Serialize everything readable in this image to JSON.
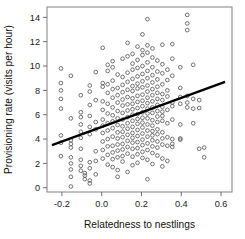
{
  "chart_data": {
    "type": "scatter",
    "title": "",
    "xlabel": "Relatedness to nestlings",
    "ylabel": "Provisioning rate (visits per hour)",
    "xlim": [
      -0.275,
      0.655
    ],
    "ylim": [
      -0.35,
      14.85
    ],
    "xticks": [
      -0.2,
      0.0,
      0.2,
      0.4,
      0.6
    ],
    "xticklabels": [
      "-0.2",
      "0.0",
      "0.2",
      "0.4",
      "0.6"
    ],
    "yticks": [
      0,
      2,
      4,
      6,
      8,
      10,
      12,
      14
    ],
    "yticklabels": [
      "0",
      "2",
      "4",
      "6",
      "8",
      "10",
      "12",
      "14"
    ],
    "grid": false,
    "legend": null,
    "marker": "open-circle",
    "marker_color": "#595959",
    "fit_line": {
      "label": "linear regression fit",
      "color": "#000000",
      "x": [
        -0.25,
        0.62
      ],
      "y": [
        3.5,
        8.7
      ],
      "slope": 5.98,
      "intercept": 4.99
    },
    "points": [
      [
        -0.205,
        9.8
      ],
      [
        -0.205,
        8.6
      ],
      [
        -0.205,
        8.0
      ],
      [
        -0.205,
        7.3
      ],
      [
        -0.205,
        6.5
      ],
      [
        -0.205,
        4.3
      ],
      [
        -0.205,
        3.7
      ],
      [
        -0.205,
        2.6
      ],
      [
        -0.155,
        9.2
      ],
      [
        -0.155,
        5.7
      ],
      [
        -0.155,
        3.9
      ],
      [
        -0.155,
        3.6
      ],
      [
        -0.155,
        3.3
      ],
      [
        -0.155,
        2.5
      ],
      [
        -0.155,
        2.0
      ],
      [
        -0.155,
        1.5
      ],
      [
        -0.155,
        0.9
      ],
      [
        -0.155,
        0.1
      ],
      [
        -0.105,
        7.6
      ],
      [
        -0.105,
        6.2
      ],
      [
        -0.105,
        5.8
      ],
      [
        -0.105,
        5.2
      ],
      [
        -0.105,
        4.6
      ],
      [
        -0.105,
        4.1
      ],
      [
        -0.105,
        3.2
      ],
      [
        -0.105,
        2.3
      ],
      [
        -0.105,
        1.8
      ],
      [
        -0.105,
        1.4
      ],
      [
        -0.085,
        1.2
      ],
      [
        -0.085,
        1.0
      ],
      [
        -0.085,
        0.7
      ],
      [
        -0.06,
        8.4
      ],
      [
        -0.06,
        7.9
      ],
      [
        -0.06,
        6.8
      ],
      [
        -0.06,
        5.9
      ],
      [
        -0.06,
        5.0
      ],
      [
        -0.06,
        4.4
      ],
      [
        -0.06,
        2.1
      ],
      [
        -0.06,
        1.6
      ],
      [
        -0.06,
        0.6
      ],
      [
        -0.06,
        0.35
      ],
      [
        -0.03,
        9.5
      ],
      [
        -0.03,
        7.2
      ],
      [
        -0.03,
        5.4
      ],
      [
        -0.03,
        4.8
      ],
      [
        -0.03,
        3.0
      ],
      [
        -0.03,
        2.2
      ],
      [
        -0.03,
        1.1
      ],
      [
        0.005,
        11.5
      ],
      [
        0.005,
        8.6
      ],
      [
        0.005,
        8.3
      ],
      [
        0.005,
        7.1
      ],
      [
        0.005,
        6.4
      ],
      [
        0.005,
        5.6
      ],
      [
        0.005,
        5.1
      ],
      [
        0.005,
        4.5
      ],
      [
        0.005,
        3.8
      ],
      [
        0.005,
        3.1
      ],
      [
        0.005,
        2.4
      ],
      [
        0.03,
        10.1
      ],
      [
        0.03,
        9.6
      ],
      [
        0.03,
        8.5
      ],
      [
        0.03,
        7.8
      ],
      [
        0.03,
        6.9
      ],
      [
        0.03,
        6.1
      ],
      [
        0.03,
        5.3
      ],
      [
        0.03,
        4.7
      ],
      [
        0.03,
        4.0
      ],
      [
        0.03,
        3.4
      ],
      [
        0.03,
        2.7
      ],
      [
        0.03,
        1.9
      ],
      [
        0.055,
        10.4
      ],
      [
        0.055,
        9.9
      ],
      [
        0.055,
        8.8
      ],
      [
        0.055,
        8.1
      ],
      [
        0.055,
        7.4
      ],
      [
        0.055,
        6.6
      ],
      [
        0.055,
        5.95
      ],
      [
        0.055,
        5.45
      ],
      [
        0.055,
        4.9
      ],
      [
        0.055,
        4.2
      ],
      [
        0.055,
        3.45
      ],
      [
        0.055,
        2.9
      ],
      [
        0.055,
        2.35
      ],
      [
        0.055,
        1.7
      ],
      [
        0.08,
        9.3
      ],
      [
        0.08,
        8.2
      ],
      [
        0.08,
        7.6
      ],
      [
        0.08,
        7.0
      ],
      [
        0.08,
        6.3
      ],
      [
        0.08,
        5.7
      ],
      [
        0.08,
        5.15
      ],
      [
        0.08,
        4.55
      ],
      [
        0.08,
        4.05
      ],
      [
        0.08,
        3.55
      ],
      [
        0.08,
        3.05
      ],
      [
        0.08,
        2.5
      ],
      [
        0.08,
        1.45
      ],
      [
        0.08,
        0.9
      ],
      [
        0.105,
        10.6
      ],
      [
        0.105,
        9.1
      ],
      [
        0.105,
        8.45
      ],
      [
        0.105,
        7.85
      ],
      [
        0.105,
        7.25
      ],
      [
        0.105,
        6.75
      ],
      [
        0.105,
        6.15
      ],
      [
        0.105,
        5.6
      ],
      [
        0.105,
        5.05
      ],
      [
        0.105,
        4.6
      ],
      [
        0.105,
        4.15
      ],
      [
        0.105,
        3.6
      ],
      [
        0.105,
        3.15
      ],
      [
        0.105,
        2.6
      ],
      [
        0.105,
        2.15
      ],
      [
        0.13,
        11.9
      ],
      [
        0.13,
        10.8
      ],
      [
        0.13,
        9.45
      ],
      [
        0.13,
        8.7
      ],
      [
        0.13,
        8.05
      ],
      [
        0.13,
        7.45
      ],
      [
        0.13,
        6.85
      ],
      [
        0.13,
        6.35
      ],
      [
        0.13,
        5.8
      ],
      [
        0.13,
        5.3
      ],
      [
        0.13,
        4.85
      ],
      [
        0.13,
        4.35
      ],
      [
        0.13,
        3.85
      ],
      [
        0.13,
        3.35
      ],
      [
        0.13,
        2.8
      ],
      [
        0.13,
        1.3
      ],
      [
        0.155,
        11.0
      ],
      [
        0.155,
        10.2
      ],
      [
        0.155,
        9.7
      ],
      [
        0.155,
        8.95
      ],
      [
        0.155,
        8.35
      ],
      [
        0.155,
        7.95
      ],
      [
        0.155,
        7.35
      ],
      [
        0.155,
        6.9
      ],
      [
        0.155,
        6.45
      ],
      [
        0.155,
        6.0
      ],
      [
        0.155,
        5.5
      ],
      [
        0.155,
        5.0
      ],
      [
        0.155,
        4.5
      ],
      [
        0.155,
        4.1
      ],
      [
        0.155,
        3.7
      ],
      [
        0.155,
        3.2
      ],
      [
        0.155,
        2.55
      ],
      [
        0.155,
        1.85
      ],
      [
        0.18,
        11.6
      ],
      [
        0.18,
        10.5
      ],
      [
        0.18,
        9.85
      ],
      [
        0.18,
        9.15
      ],
      [
        0.18,
        8.55
      ],
      [
        0.18,
        8.15
      ],
      [
        0.18,
        7.55
      ],
      [
        0.18,
        7.05
      ],
      [
        0.18,
        6.55
      ],
      [
        0.18,
        6.05
      ],
      [
        0.18,
        5.65
      ],
      [
        0.18,
        5.25
      ],
      [
        0.18,
        4.75
      ],
      [
        0.18,
        4.25
      ],
      [
        0.18,
        3.75
      ],
      [
        0.18,
        3.25
      ],
      [
        0.18,
        2.75
      ],
      [
        0.18,
        2.05
      ],
      [
        0.205,
        12.6
      ],
      [
        0.205,
        11.3
      ],
      [
        0.205,
        10.9
      ],
      [
        0.205,
        10.0
      ],
      [
        0.205,
        9.35
      ],
      [
        0.205,
        8.75
      ],
      [
        0.205,
        8.25
      ],
      [
        0.205,
        7.65
      ],
      [
        0.205,
        7.15
      ],
      [
        0.205,
        6.7
      ],
      [
        0.205,
        6.2
      ],
      [
        0.205,
        5.75
      ],
      [
        0.205,
        5.35
      ],
      [
        0.205,
        4.95
      ],
      [
        0.205,
        4.45
      ],
      [
        0.205,
        3.95
      ],
      [
        0.205,
        3.5
      ],
      [
        0.205,
        2.95
      ],
      [
        0.205,
        2.45
      ],
      [
        0.23,
        13.85
      ],
      [
        0.23,
        11.7
      ],
      [
        0.23,
        11.1
      ],
      [
        0.23,
        10.3
      ],
      [
        0.23,
        9.6
      ],
      [
        0.23,
        9.0
      ],
      [
        0.23,
        8.4
      ],
      [
        0.23,
        7.9
      ],
      [
        0.23,
        7.4
      ],
      [
        0.23,
        6.95
      ],
      [
        0.23,
        6.5
      ],
      [
        0.23,
        6.1
      ],
      [
        0.23,
        5.7
      ],
      [
        0.23,
        5.2
      ],
      [
        0.23,
        4.7
      ],
      [
        0.23,
        4.2
      ],
      [
        0.23,
        3.65
      ],
      [
        0.23,
        3.1
      ],
      [
        0.23,
        2.3
      ],
      [
        0.23,
        0.7
      ],
      [
        0.255,
        11.45
      ],
      [
        0.255,
        10.7
      ],
      [
        0.255,
        9.9
      ],
      [
        0.255,
        9.25
      ],
      [
        0.255,
        8.65
      ],
      [
        0.255,
        8.1
      ],
      [
        0.255,
        7.6
      ],
      [
        0.255,
        7.1
      ],
      [
        0.255,
        6.6
      ],
      [
        0.255,
        6.15
      ],
      [
        0.255,
        5.55
      ],
      [
        0.255,
        5.1
      ],
      [
        0.255,
        4.65
      ],
      [
        0.255,
        4.3
      ],
      [
        0.255,
        3.9
      ],
      [
        0.255,
        3.4
      ],
      [
        0.255,
        2.85
      ],
      [
        0.255,
        1.95
      ],
      [
        0.28,
        10.45
      ],
      [
        0.28,
        9.55
      ],
      [
        0.28,
        8.9
      ],
      [
        0.28,
        8.3
      ],
      [
        0.28,
        7.8
      ],
      [
        0.28,
        7.3
      ],
      [
        0.28,
        6.8
      ],
      [
        0.28,
        6.3
      ],
      [
        0.28,
        5.85
      ],
      [
        0.28,
        5.4
      ],
      [
        0.28,
        4.8
      ],
      [
        0.28,
        4.4
      ],
      [
        0.28,
        3.8
      ],
      [
        0.28,
        3.3
      ],
      [
        0.28,
        2.65
      ],
      [
        0.305,
        11.75
      ],
      [
        0.305,
        10.15
      ],
      [
        0.305,
        9.4
      ],
      [
        0.305,
        8.5
      ],
      [
        0.305,
        7.7
      ],
      [
        0.305,
        7.2
      ],
      [
        0.305,
        6.65
      ],
      [
        0.305,
        6.25
      ],
      [
        0.305,
        5.9
      ],
      [
        0.305,
        5.5
      ],
      [
        0.305,
        4.55
      ],
      [
        0.305,
        4.05
      ],
      [
        0.305,
        3.55
      ],
      [
        0.305,
        2.4
      ],
      [
        0.305,
        1.75
      ],
      [
        0.33,
        9.7
      ],
      [
        0.33,
        8.85
      ],
      [
        0.33,
        8.0
      ],
      [
        0.33,
        7.5
      ],
      [
        0.33,
        6.4
      ],
      [
        0.33,
        5.3
      ],
      [
        0.33,
        4.15
      ],
      [
        0.33,
        3.45
      ],
      [
        0.33,
        2.2
      ],
      [
        0.355,
        11.8
      ],
      [
        0.355,
        10.6
      ],
      [
        0.355,
        9.2
      ],
      [
        0.355,
        7.0
      ],
      [
        0.355,
        6.7
      ],
      [
        0.355,
        5.6
      ],
      [
        0.355,
        4.0
      ],
      [
        0.355,
        3.6
      ],
      [
        0.355,
        3.35
      ],
      [
        0.395,
        9.9
      ],
      [
        0.395,
        8.2
      ],
      [
        0.395,
        7.45
      ],
      [
        0.395,
        6.9
      ],
      [
        0.395,
        5.2
      ],
      [
        0.395,
        4.05
      ],
      [
        0.395,
        3.95
      ],
      [
        0.43,
        14.2
      ],
      [
        0.43,
        13.5
      ],
      [
        0.43,
        12.95
      ],
      [
        0.43,
        7.55
      ],
      [
        0.43,
        7.0
      ],
      [
        0.43,
        6.6
      ],
      [
        0.46,
        10.1
      ],
      [
        0.46,
        7.3
      ],
      [
        0.46,
        6.5
      ],
      [
        0.46,
        5.3
      ],
      [
        0.49,
        7.2
      ],
      [
        0.49,
        6.55
      ],
      [
        0.49,
        3.2
      ],
      [
        0.515,
        3.3
      ],
      [
        0.515,
        2.5
      ]
    ]
  }
}
